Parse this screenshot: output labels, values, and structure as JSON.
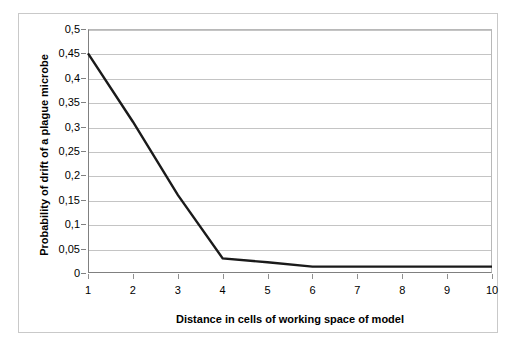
{
  "chart_data": {
    "type": "line",
    "title": "",
    "xlabel": "Distance in cells of working space of model",
    "ylabel": "Probability of drift of a plague microbe",
    "x": [
      1,
      2,
      3,
      4,
      5,
      6,
      7,
      8,
      9,
      10
    ],
    "categories": [
      "1",
      "2",
      "3",
      "4",
      "5",
      "6",
      "7",
      "8",
      "9",
      "10"
    ],
    "series": [
      {
        "name": "Probability of drift",
        "values": [
          0.45,
          0.31,
          0.16,
          0.03,
          0.022,
          0.013,
          0.013,
          0.013,
          0.013,
          0.013
        ]
      }
    ],
    "ylim": [
      0,
      0.5
    ],
    "ytick_values": [
      0,
      0.05,
      0.1,
      0.15,
      0.2,
      0.25,
      0.3,
      0.35,
      0.4,
      0.45,
      0.5
    ],
    "ytick_labels": [
      "0",
      "0,05",
      "0,1",
      "0,15",
      "0,2",
      "0,25",
      "0,3",
      "0,35",
      "0,4",
      "0,45",
      "0,5"
    ],
    "xtick_labels": [
      "1",
      "2",
      "3",
      "4",
      "5",
      "6",
      "7",
      "8",
      "9",
      "10"
    ],
    "grid": "horizontal",
    "legend": "none",
    "line_color": "#1a1a1a",
    "grid_color": "#c4c4c4",
    "axis_color": "#808080",
    "background": "#ffffff"
  }
}
